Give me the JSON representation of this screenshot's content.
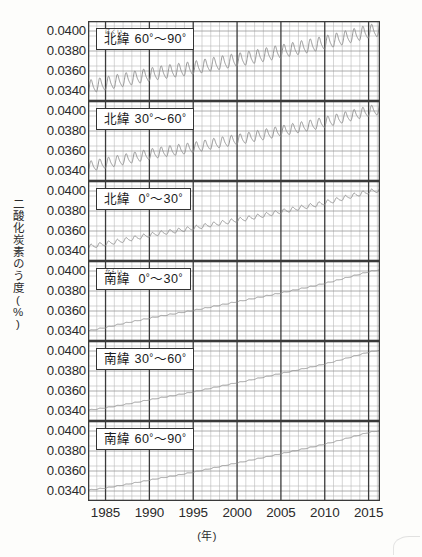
{
  "axes": {
    "y_title": "二酸化炭素のう度(%)",
    "y_ticks": [
      "0.0400",
      "0.0380",
      "0.0360",
      "0.0340"
    ],
    "x_ticks": [
      "1985",
      "1990",
      "1995",
      "2000",
      "2005",
      "2010",
      "2015"
    ],
    "x_unit": "(年)"
  },
  "panels": [
    {
      "id": "north-60-90",
      "ruby": "ほくい",
      "kanji": "北緯",
      "range_from": "60",
      "range_to": "90",
      "caption": "北緯 60°〜90°"
    },
    {
      "id": "north-30-60",
      "ruby": "",
      "kanji": "北緯",
      "range_from": "30",
      "range_to": "60",
      "caption": "北緯 30°〜60°"
    },
    {
      "id": "north-0-30",
      "ruby": "",
      "kanji": "北緯",
      "range_from": "0",
      "range_to": "30",
      "caption": "北緯 0°〜30°"
    },
    {
      "id": "south-0-30",
      "ruby": "なんい",
      "kanji": "南緯",
      "range_from": "0",
      "range_to": "30",
      "caption": "南緯 0°〜30°"
    },
    {
      "id": "south-30-60",
      "ruby": "",
      "kanji": "南緯",
      "range_from": "30",
      "range_to": "60",
      "caption": "南緯 30°〜60°"
    },
    {
      "id": "south-60-90",
      "ruby": "",
      "kanji": "南緯",
      "range_from": "60",
      "range_to": "90",
      "caption": "南緯 60°〜90°"
    }
  ],
  "chart_data": {
    "type": "line",
    "title": "",
    "xlabel": "(年)",
    "ylabel": "二酸化炭素のう度(%)",
    "xlim": [
      1983.0,
      2016.3
    ],
    "ylim": [
      0.033,
      0.041
    ],
    "yticks": [
      0.034,
      0.036,
      0.038,
      0.04
    ],
    "xticks": [
      1985,
      1990,
      1995,
      2000,
      2005,
      2010,
      2015
    ],
    "grid": "major every 5 years and every 0.0020; minor every 1 year and every 0.0005",
    "legend": "none (panel captions)",
    "series": [
      {
        "name": "北緯 60°〜90°",
        "trend_start": 0.03435,
        "trend_end": 0.04005,
        "seasonal_amplitude": 0.0007,
        "seasonal_period_years": 1,
        "values": [
          {
            "year": 1983,
            "value": 0.03435
          },
          {
            "year": 1985,
            "value": 0.0347
          },
          {
            "year": 1987,
            "value": 0.03505
          },
          {
            "year": 1989,
            "value": 0.0354
          },
          {
            "year": 1991,
            "value": 0.03575
          },
          {
            "year": 1993,
            "value": 0.036
          },
          {
            "year": 1995,
            "value": 0.03625
          },
          {
            "year": 1997,
            "value": 0.0366
          },
          {
            "year": 1999,
            "value": 0.0369
          },
          {
            "year": 2001,
            "value": 0.0372
          },
          {
            "year": 2003,
            "value": 0.03755
          },
          {
            "year": 2005,
            "value": 0.0379
          },
          {
            "year": 2007,
            "value": 0.03825
          },
          {
            "year": 2009,
            "value": 0.0386
          },
          {
            "year": 2011,
            "value": 0.039
          },
          {
            "year": 2013,
            "value": 0.03945
          },
          {
            "year": 2015,
            "value": 0.0399
          },
          {
            "year": 2016,
            "value": 0.04005
          }
        ]
      },
      {
        "name": "北緯 30°〜60°",
        "trend_start": 0.0344,
        "trend_end": 0.0401,
        "seasonal_amplitude": 0.00055,
        "seasonal_period_years": 1,
        "values": [
          {
            "year": 1983,
            "value": 0.0344
          },
          {
            "year": 1985,
            "value": 0.03475
          },
          {
            "year": 1987,
            "value": 0.0351
          },
          {
            "year": 1989,
            "value": 0.03545
          },
          {
            "year": 1991,
            "value": 0.0358
          },
          {
            "year": 1993,
            "value": 0.03605
          },
          {
            "year": 1995,
            "value": 0.0363
          },
          {
            "year": 1997,
            "value": 0.03665
          },
          {
            "year": 1999,
            "value": 0.03695
          },
          {
            "year": 2001,
            "value": 0.03725
          },
          {
            "year": 2003,
            "value": 0.0376
          },
          {
            "year": 2005,
            "value": 0.03795
          },
          {
            "year": 2007,
            "value": 0.0383
          },
          {
            "year": 2009,
            "value": 0.03865
          },
          {
            "year": 2011,
            "value": 0.03905
          },
          {
            "year": 2013,
            "value": 0.0395
          },
          {
            "year": 2015,
            "value": 0.03995
          },
          {
            "year": 2016,
            "value": 0.0401
          }
        ]
      },
      {
        "name": "北緯 0°〜30°",
        "trend_start": 0.0344,
        "trend_end": 0.04005,
        "seasonal_amplitude": 0.00022,
        "seasonal_period_years": 1,
        "values": [
          {
            "year": 1983,
            "value": 0.0344
          },
          {
            "year": 1985,
            "value": 0.03472
          },
          {
            "year": 1987,
            "value": 0.03505
          },
          {
            "year": 1989,
            "value": 0.0354
          },
          {
            "year": 1991,
            "value": 0.03575
          },
          {
            "year": 1993,
            "value": 0.036
          },
          {
            "year": 1995,
            "value": 0.03628
          },
          {
            "year": 1997,
            "value": 0.03662
          },
          {
            "year": 1999,
            "value": 0.03692
          },
          {
            "year": 2001,
            "value": 0.03722
          },
          {
            "year": 2003,
            "value": 0.03756
          },
          {
            "year": 2005,
            "value": 0.03792
          },
          {
            "year": 2007,
            "value": 0.03828
          },
          {
            "year": 2009,
            "value": 0.03862
          },
          {
            "year": 2011,
            "value": 0.03902
          },
          {
            "year": 2013,
            "value": 0.03948
          },
          {
            "year": 2015,
            "value": 0.03992
          },
          {
            "year": 2016,
            "value": 0.04005
          }
        ]
      },
      {
        "name": "南緯 0°〜30°",
        "trend_start": 0.034,
        "trend_end": 0.0401,
        "seasonal_amplitude": 5e-05,
        "seasonal_period_years": 1,
        "values": [
          {
            "year": 1983,
            "value": 0.034
          },
          {
            "year": 1985,
            "value": 0.03435
          },
          {
            "year": 1987,
            "value": 0.03475
          },
          {
            "year": 1989,
            "value": 0.0351
          },
          {
            "year": 1991,
            "value": 0.03545
          },
          {
            "year": 1993,
            "value": 0.03575
          },
          {
            "year": 1995,
            "value": 0.03605
          },
          {
            "year": 1997,
            "value": 0.0364
          },
          {
            "year": 1999,
            "value": 0.03675
          },
          {
            "year": 2001,
            "value": 0.0371
          },
          {
            "year": 2003,
            "value": 0.03745
          },
          {
            "year": 2005,
            "value": 0.0378
          },
          {
            "year": 2007,
            "value": 0.03818
          },
          {
            "year": 2009,
            "value": 0.03855
          },
          {
            "year": 2011,
            "value": 0.03898
          },
          {
            "year": 2013,
            "value": 0.03945
          },
          {
            "year": 2015,
            "value": 0.03992
          },
          {
            "year": 2016,
            "value": 0.0401
          }
        ]
      },
      {
        "name": "南緯 30°〜60°",
        "trend_start": 0.03408,
        "trend_end": 0.04005,
        "seasonal_amplitude": 4e-05,
        "seasonal_period_years": 1,
        "values": [
          {
            "year": 1983,
            "value": 0.03408
          },
          {
            "year": 1985,
            "value": 0.03432
          },
          {
            "year": 1987,
            "value": 0.03462
          },
          {
            "year": 1989,
            "value": 0.03495
          },
          {
            "year": 1991,
            "value": 0.03528
          },
          {
            "year": 1993,
            "value": 0.03558
          },
          {
            "year": 1995,
            "value": 0.0359
          },
          {
            "year": 1997,
            "value": 0.03628
          },
          {
            "year": 1999,
            "value": 0.03665
          },
          {
            "year": 2001,
            "value": 0.037
          },
          {
            "year": 2003,
            "value": 0.03738
          },
          {
            "year": 2005,
            "value": 0.03775
          },
          {
            "year": 2007,
            "value": 0.03812
          },
          {
            "year": 2009,
            "value": 0.0385
          },
          {
            "year": 2011,
            "value": 0.03892
          },
          {
            "year": 2013,
            "value": 0.0394
          },
          {
            "year": 2015,
            "value": 0.03988
          },
          {
            "year": 2016,
            "value": 0.04005
          }
        ]
      },
      {
        "name": "南緯 60°〜90°",
        "trend_start": 0.03408,
        "trend_end": 0.04,
        "seasonal_amplitude": 4e-05,
        "seasonal_period_years": 1,
        "values": [
          {
            "year": 1983,
            "value": 0.03408
          },
          {
            "year": 1985,
            "value": 0.0343
          },
          {
            "year": 1987,
            "value": 0.0346
          },
          {
            "year": 1989,
            "value": 0.03492
          },
          {
            "year": 1991,
            "value": 0.03525
          },
          {
            "year": 1993,
            "value": 0.03555
          },
          {
            "year": 1995,
            "value": 0.03588
          },
          {
            "year": 1997,
            "value": 0.03625
          },
          {
            "year": 1999,
            "value": 0.03662
          },
          {
            "year": 2001,
            "value": 0.03698
          },
          {
            "year": 2003,
            "value": 0.03735
          },
          {
            "year": 2005,
            "value": 0.03772
          },
          {
            "year": 2007,
            "value": 0.0381
          },
          {
            "year": 2009,
            "value": 0.03848
          },
          {
            "year": 2011,
            "value": 0.0389
          },
          {
            "year": 2013,
            "value": 0.03938
          },
          {
            "year": 2015,
            "value": 0.03985
          },
          {
            "year": 2016,
            "value": 0.04
          }
        ]
      }
    ]
  }
}
